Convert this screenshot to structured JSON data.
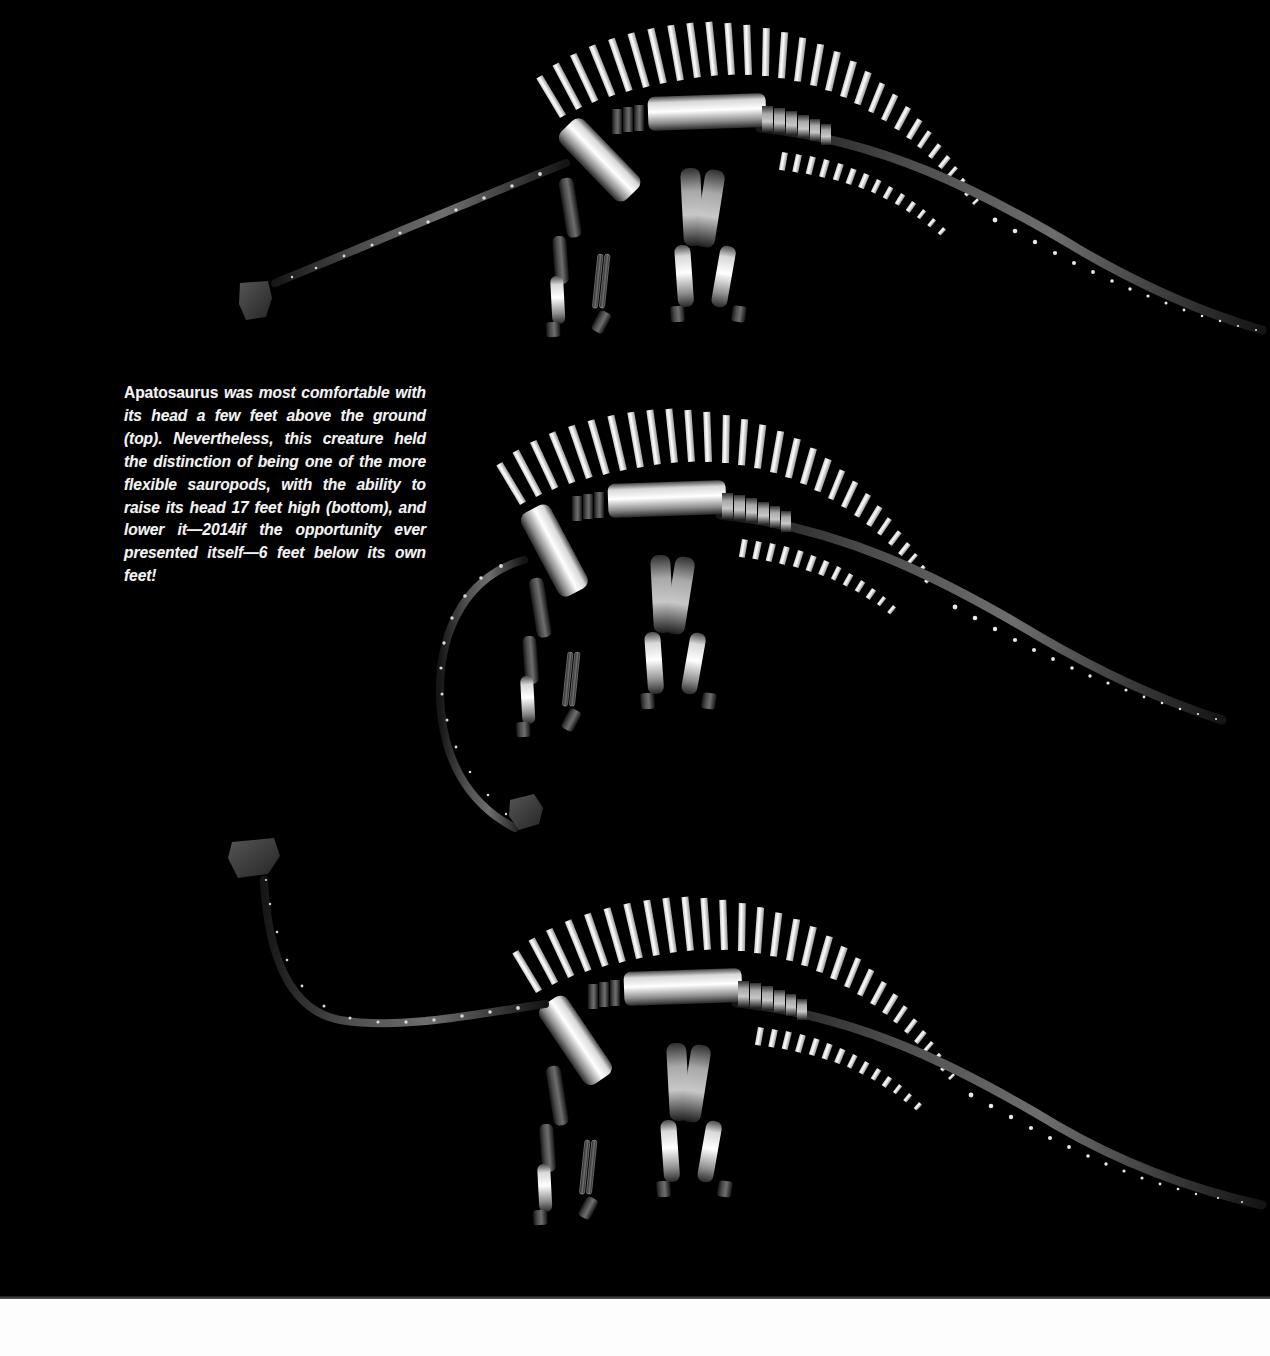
{
  "page": {
    "background_color": "#000000",
    "band_color": "#fdfdfd"
  },
  "caption": {
    "genus": "Apatosaurus",
    "rest": " was most comfortable with its head a few feet above the ground (top). Nevertheless, this creature held the distinction of being one of the more flexible sauropods, with the ability to raise its head 17 feet high (bottom), and lower it—2014if the opportunity ever presented itself—6 feet below its own feet!",
    "full_text": "Apatosaurus was most comfortable with its head a few feet above the ground (top). Nevertheless, this creature held the distinction of being one of the more flexible sauropods, with the ability to raise its head 17 feet high (bottom), and lower it—6 feet below its own feet!"
  },
  "figures": [
    {
      "id": "apatosaurus-neck-level",
      "label": "top",
      "pose_description": "head held a few feet above the ground, neck angled down-forward",
      "head_height_ft": 3
    },
    {
      "id": "apatosaurus-neck-lowered",
      "label": "middle",
      "pose_description": "neck curled downward, head 6 feet below its own feet",
      "head_height_ft": -6
    },
    {
      "id": "apatosaurus-neck-raised",
      "label": "bottom",
      "pose_description": "head raised 17 feet high, neck swept up and back",
      "head_height_ft": 17
    }
  ],
  "skeleton_parts": [
    "head",
    "cervical-vertebrae",
    "scapula",
    "dorsal-vertebrae",
    "dorsal-spines",
    "ribs",
    "pelvis",
    "caudal-vertebrae",
    "caudal-spines",
    "chevrons",
    "forelimb-humerus",
    "forelimb-radius",
    "forelimb-foot",
    "hindlimb-femur",
    "hindlimb-tibia",
    "hindlimb-foot"
  ],
  "colors": {
    "bone_bright": "#f2f2f2",
    "bone_mid": "#9a9a9a",
    "bone_dark": "#3c3c3c",
    "bone_shadow": "#1a1a1a",
    "background": "#000000",
    "caption_text": "#f2f2f2"
  }
}
